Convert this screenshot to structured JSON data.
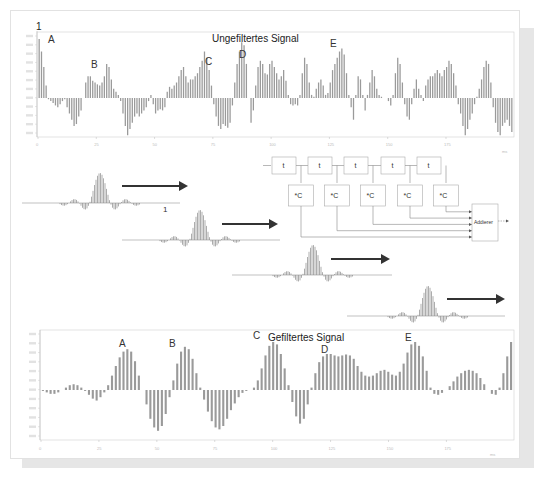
{
  "top_chart": {
    "title": "Ungefiltertes Signal",
    "marker_label": "1",
    "annotations": [
      {
        "label": "A",
        "x": 48,
        "y": 43
      },
      {
        "label": "B",
        "x": 91,
        "y": 68
      },
      {
        "label": "C",
        "x": 205,
        "y": 65
      },
      {
        "label": "D",
        "x": 239,
        "y": 58
      },
      {
        "label": "E",
        "x": 330,
        "y": 47
      }
    ],
    "x_ticks": [
      "0",
      "25",
      "50",
      "75",
      "100",
      "125",
      "150",
      "175"
    ],
    "x_unit": "ms"
  },
  "bottom_chart": {
    "title": "Gefiltertes Signal",
    "annotations": [
      {
        "label": "A",
        "x": 119,
        "y": 347
      },
      {
        "label": "B",
        "x": 169,
        "y": 347
      },
      {
        "label": "C",
        "x": 253,
        "y": 339
      },
      {
        "label": "D",
        "x": 321,
        "y": 353
      },
      {
        "label": "E",
        "x": 405,
        "y": 341
      }
    ],
    "x_ticks": [
      "0",
      "25",
      "50",
      "75",
      "100",
      "125",
      "150",
      "175"
    ],
    "x_unit": "ms"
  },
  "block_diagram": {
    "delay_label": "t",
    "coef_label": "*C",
    "adder_label": "Addierer",
    "delay_count": 5
  },
  "pulses": {
    "first_label": "1"
  },
  "colors": {
    "bar": "#9a9a9a",
    "frame": "#cccccc",
    "arrow": "#333333",
    "line": "#888888"
  },
  "chart_data": [
    {
      "type": "bar",
      "title": "Ungefiltertes Signal",
      "xlabel": "ms",
      "ylabel": "",
      "x_ticks": [
        0,
        25,
        50,
        75,
        100,
        125,
        150,
        175
      ],
      "xlim": [
        0,
        200
      ],
      "ylim": [
        -1,
        1
      ],
      "grid": false,
      "annotations": [
        "A",
        "B",
        "C",
        "D",
        "E"
      ],
      "values": [
        0.95,
        0.75,
        0.5,
        0.2,
        -0.02,
        -0.05,
        -0.08,
        -0.12,
        -0.15,
        -0.1,
        -0.05,
        -0.02,
        -0.15,
        -0.25,
        -0.35,
        -0.45,
        -0.42,
        -0.3,
        -0.2,
        0.0,
        0.25,
        0.35,
        0.35,
        0.28,
        0.25,
        0.22,
        0.2,
        0.25,
        0.35,
        0.55,
        0.5,
        0.3,
        0.15,
        0.1,
        0.05,
        -0.05,
        -0.25,
        -0.45,
        -0.6,
        -0.5,
        -0.4,
        -0.3,
        -0.25,
        -0.3,
        -0.25,
        -0.2,
        -0.15,
        -0.05,
        0.05,
        -0.1,
        -0.25,
        -0.2,
        -0.18,
        -0.2,
        -0.15,
        0.1,
        0.18,
        0.15,
        0.2,
        0.25,
        0.35,
        0.45,
        0.5,
        0.35,
        0.25,
        0.3,
        0.3,
        0.35,
        0.4,
        0.5,
        0.6,
        0.75,
        0.65,
        0.45,
        0.2,
        -0.1,
        -0.3,
        -0.45,
        -0.5,
        -0.42,
        -0.45,
        -0.48,
        -0.4,
        -0.12,
        0.25,
        0.55,
        0.75,
        0.9,
        0.85,
        0.55,
        0.0,
        -0.4,
        -0.2,
        0.2,
        0.5,
        0.6,
        0.55,
        0.4,
        0.38,
        0.55,
        0.6,
        0.5,
        0.4,
        0.3,
        0.35,
        0.45,
        0.28,
        0.05,
        -0.1,
        -0.12,
        -0.1,
        -0.12,
        0.05,
        0.4,
        0.65,
        0.55,
        0.25,
        0.05,
        0.02,
        0.15,
        0.25,
        0.3,
        0.2,
        0.05,
        0.08,
        0.25,
        0.45,
        0.55,
        0.65,
        0.75,
        0.8,
        0.7,
        0.4,
        0.05,
        -0.15,
        -0.35,
        0.05,
        0.35,
        0.3,
        0.05,
        -0.2,
        0.05,
        0.25,
        0.45,
        0.35,
        0.15,
        0.05,
        0.02,
        0.0,
        0.0,
        -0.05,
        -0.12,
        0.05,
        0.4,
        0.65,
        0.55,
        0.25,
        -0.1,
        -0.3,
        -0.35,
        -0.1,
        0.15,
        0.3,
        0.15,
        0.05,
        -0.05,
        0.2,
        0.3,
        0.35,
        0.35,
        0.4,
        0.45,
        0.4,
        0.35,
        0.45,
        0.5,
        0.6,
        0.55,
        0.4,
        0.2,
        -0.1,
        -0.25,
        -0.45,
        -0.6,
        -0.5,
        -0.35,
        -0.25,
        -0.1,
        0.02,
        0.15,
        0.3,
        0.5,
        0.6,
        0.55,
        0.25,
        -0.15,
        -0.4,
        -0.55,
        -0.6,
        -0.45,
        -0.4,
        -0.35,
        -0.45,
        -0.55
      ]
    },
    {
      "type": "bar",
      "title": "Gefiltertes Signal",
      "xlabel": "ms",
      "ylabel": "",
      "x_ticks": [
        0,
        25,
        50,
        75,
        100,
        125,
        150,
        175
      ],
      "xlim": [
        0,
        200
      ],
      "ylim": [
        -1,
        1
      ],
      "grid": false,
      "annotations": [
        "A",
        "B",
        "C",
        "D",
        "E"
      ],
      "values": [
        -0.02,
        -0.05,
        -0.08,
        -0.08,
        -0.05,
        0.0,
        0.05,
        0.1,
        0.12,
        0.1,
        0.05,
        -0.02,
        -0.1,
        -0.18,
        -0.22,
        -0.15,
        -0.05,
        0.1,
        0.3,
        0.5,
        0.68,
        0.8,
        0.85,
        0.8,
        0.6,
        0.3,
        0.0,
        -0.3,
        -0.6,
        -0.78,
        -0.85,
        -0.75,
        -0.5,
        -0.15,
        0.2,
        0.55,
        0.8,
        0.9,
        0.85,
        0.65,
        0.35,
        0.05,
        -0.2,
        -0.45,
        -0.65,
        -0.78,
        -0.82,
        -0.75,
        -0.6,
        -0.42,
        -0.28,
        -0.15,
        -0.06,
        -0.02,
        0.0,
        0.05,
        0.2,
        0.45,
        0.72,
        0.92,
        1.0,
        0.95,
        0.75,
        0.45,
        0.1,
        -0.25,
        -0.55,
        -0.7,
        -0.6,
        -0.3,
        0.05,
        0.35,
        0.58,
        0.7,
        0.75,
        0.75,
        0.72,
        0.7,
        0.72,
        0.74,
        0.72,
        0.65,
        0.5,
        0.38,
        0.3,
        0.28,
        0.3,
        0.35,
        0.4,
        0.42,
        0.38,
        0.32,
        0.3,
        0.38,
        0.55,
        0.78,
        0.95,
        1.0,
        0.92,
        0.7,
        0.4,
        0.05,
        -0.08,
        -0.1,
        -0.06,
        0.0,
        0.08,
        0.18,
        0.28,
        0.35,
        0.4,
        0.42,
        0.4,
        0.35,
        0.25,
        0.12,
        0.0,
        -0.08,
        -0.1,
        0.05,
        0.35,
        0.7,
        1.0
      ]
    }
  ]
}
